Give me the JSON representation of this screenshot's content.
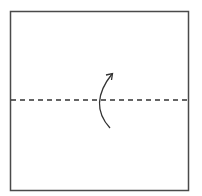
{
  "diagram": {
    "type": "origami-fold-step",
    "paper": {
      "x": 10,
      "y": 11,
      "width": 179,
      "height": 180,
      "stroke": "#4a4a4a",
      "fill": "#ffffff"
    },
    "fold_line": {
      "style": "valley-fold-dashed",
      "y": 100,
      "x1": 10,
      "x2": 189,
      "stroke": "#333333"
    },
    "arrow": {
      "direction": "fold-bottom-up",
      "stroke": "#333333"
    }
  }
}
